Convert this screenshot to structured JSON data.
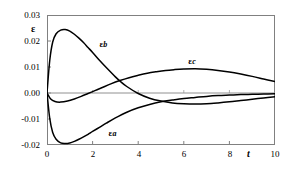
{
  "chart_data": {
    "type": "line",
    "title": "",
    "xlabel": "t",
    "ylabel": "ε",
    "xlim": [
      0,
      10
    ],
    "ylim": [
      -0.02,
      0.03
    ],
    "grid": false,
    "legend_position": "inline-annotations",
    "x_ticks": [
      0,
      2,
      4,
      6,
      8,
      10
    ],
    "x_tick_labels": [
      "0",
      "2",
      "4",
      "6",
      "8",
      "10"
    ],
    "y_ticks": [
      -0.02,
      -0.01,
      0.0,
      0.01,
      0.02,
      0.03
    ],
    "y_tick_labels": [
      "-0.02",
      "-0.01",
      "0.00",
      "0.01",
      "0.02",
      "0.03"
    ],
    "annotations": [
      {
        "text": "ε",
        "sub": "b",
        "x": 2.3,
        "y": 0.0185
      },
      {
        "text": "ε",
        "sub": "c",
        "x": 6.2,
        "y": 0.0118
      },
      {
        "text": "ε",
        "sub": "a",
        "x": 2.7,
        "y": -0.0158
      }
    ],
    "series": [
      {
        "name": "ε_b",
        "label": "εb",
        "color": "#000000",
        "x": [
          0.0,
          0.12,
          0.25,
          0.4,
          0.6,
          0.8,
          1.0,
          1.2,
          1.4,
          1.6,
          1.8,
          2.0,
          2.3,
          2.6,
          3.0,
          3.2,
          3.5,
          4.0,
          4.5,
          5.0,
          5.5,
          6.0,
          6.5,
          7.0,
          7.5,
          8.0,
          8.5,
          9.0,
          9.5,
          10.0
        ],
        "y": [
          0.0,
          0.0125,
          0.0196,
          0.0228,
          0.0242,
          0.0244,
          0.0238,
          0.0226,
          0.0211,
          0.0194,
          0.0175,
          0.0156,
          0.0126,
          0.0098,
          0.0062,
          0.0046,
          0.0025,
          -0.0002,
          -0.002,
          -0.0031,
          -0.0038,
          -0.0041,
          -0.0042,
          -0.0041,
          -0.0038,
          -0.0034,
          -0.0029,
          -0.0024,
          -0.0019,
          -0.0014
        ]
      },
      {
        "name": "ε_a",
        "label": "εa",
        "color": "#000000",
        "x": [
          0.0,
          0.12,
          0.25,
          0.4,
          0.6,
          0.8,
          1.0,
          1.2,
          1.4,
          1.6,
          1.8,
          2.0,
          2.3,
          2.6,
          3.0,
          3.5,
          4.0,
          4.5,
          5.0,
          5.5,
          6.0,
          6.5,
          7.0,
          7.5,
          8.0,
          8.5,
          9.0,
          9.5,
          10.0
        ],
        "y": [
          0.0,
          -0.0098,
          -0.0152,
          -0.0178,
          -0.0192,
          -0.0194,
          -0.0192,
          -0.0186,
          -0.0178,
          -0.0169,
          -0.0159,
          -0.0148,
          -0.0132,
          -0.0116,
          -0.0096,
          -0.0074,
          -0.0057,
          -0.0044,
          -0.0034,
          -0.0027,
          -0.0021,
          -0.0017,
          -0.0013,
          -0.001,
          -0.0008,
          -0.0006,
          -0.0005,
          -0.0004,
          -0.0003
        ]
      },
      {
        "name": "ε_c",
        "label": "εc",
        "color": "#000000",
        "x": [
          0.0,
          0.15,
          0.35,
          0.6,
          0.9,
          1.2,
          1.5,
          1.8,
          2.1,
          2.4,
          2.8,
          3.2,
          3.6,
          4.0,
          4.4,
          4.8,
          5.2,
          5.6,
          6.0,
          6.5,
          7.0,
          7.5,
          8.0,
          8.5,
          9.0,
          9.5,
          10.0
        ],
        "y": [
          0.0,
          -0.0022,
          -0.0033,
          -0.0035,
          -0.0031,
          -0.0023,
          -0.0013,
          -0.0002,
          0.0009,
          0.002,
          0.0035,
          0.0048,
          0.0059,
          0.0068,
          0.0076,
          0.0082,
          0.0087,
          0.009,
          0.0092,
          0.0093,
          0.0091,
          0.0087,
          0.0081,
          0.0073,
          0.0064,
          0.0054,
          0.0044
        ]
      }
    ]
  },
  "axes": {
    "y_axis_name": "ε",
    "x_axis_name": "t"
  }
}
